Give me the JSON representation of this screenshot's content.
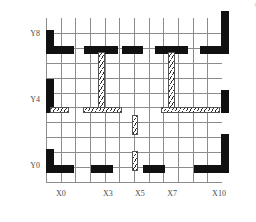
{
  "figure": {
    "type": "structural-floor-plan",
    "corner_note": "4F",
    "background_color": "#ffffff",
    "grid_color": "#8c8c8c",
    "solid_wall_color": "#111111",
    "hatch_wall_color": "#2b2b2b"
  },
  "axes": {
    "x_label_values": [
      "X0",
      "X3",
      "X5",
      "X7",
      "X10"
    ],
    "y_label_values": [
      "Y8",
      "Y4",
      "Y0"
    ],
    "x_grid_lines": 12,
    "y_grid_lines": 11,
    "x_range": [
      0,
      11
    ],
    "y_range": [
      0,
      10
    ]
  },
  "x_ticks": [
    {
      "label": "X0",
      "pos_pct": 8.5
    },
    {
      "label": "X3",
      "pos_pct": 35.2
    },
    {
      "label": "X5",
      "pos_pct": 53.4
    },
    {
      "label": "X7",
      "pos_pct": 71.6
    },
    {
      "label": "X10",
      "pos_pct": 98.3
    }
  ],
  "y_ticks": [
    {
      "label": "Y8",
      "pos_pct": 9.8
    },
    {
      "label": "Y4",
      "pos_pct": 50.0
    },
    {
      "label": "Y0",
      "pos_pct": 90.2
    }
  ],
  "chart_data": {
    "type": "table",
    "title": "",
    "legend": [
      {
        "key": "solid",
        "meaning": "reinforced-concrete shear wall"
      },
      {
        "key": "hatch",
        "meaning": "hatched infill / partition wall"
      }
    ],
    "walls_solid": [
      {
        "id": "w-tl-h",
        "x": 0.0,
        "y": 8.6,
        "w": 1.9,
        "h": 0.55
      },
      {
        "id": "w-tl-v",
        "x": 0.0,
        "y": 8.6,
        "w": 0.55,
        "h": 1.6
      },
      {
        "id": "w-t1",
        "x": 2.6,
        "y": 8.6,
        "w": 2.3,
        "h": 0.55
      },
      {
        "id": "w-t2",
        "x": 5.2,
        "y": 8.6,
        "w": 1.4,
        "h": 0.55
      },
      {
        "id": "w-t3",
        "x": 7.4,
        "y": 8.6,
        "w": 2.3,
        "h": 0.55
      },
      {
        "id": "w-tr-h",
        "x": 10.5,
        "y": 8.6,
        "w": 2.0,
        "h": 0.55
      },
      {
        "id": "w-tr-v",
        "x": 11.95,
        "y": 8.6,
        "w": 0.55,
        "h": 2.9
      },
      {
        "id": "w-ml-v",
        "x": 0.0,
        "y": 4.6,
        "w": 0.55,
        "h": 2.3
      },
      {
        "id": "w-mr-v",
        "x": 11.95,
        "y": 4.6,
        "w": 0.55,
        "h": 1.6
      },
      {
        "id": "w-br-v",
        "x": 11.95,
        "y": 0.6,
        "w": 0.55,
        "h": 2.6
      },
      {
        "id": "w-bl-v",
        "x": 0.0,
        "y": 0.6,
        "w": 0.55,
        "h": 1.6
      },
      {
        "id": "w-bl-h",
        "x": 0.0,
        "y": 0.6,
        "w": 1.9,
        "h": 0.55
      },
      {
        "id": "w-b1",
        "x": 3.1,
        "y": 0.6,
        "w": 1.5,
        "h": 0.55
      },
      {
        "id": "w-b2",
        "x": 6.6,
        "y": 0.6,
        "w": 1.5,
        "h": 0.55
      },
      {
        "id": "w-br-h",
        "x": 10.1,
        "y": 0.6,
        "w": 2.4,
        "h": 0.55
      }
    ],
    "walls_hatched": [
      {
        "id": "h-t-x3",
        "x": 3.55,
        "y": 4.9,
        "w": 0.45,
        "h": 3.8
      },
      {
        "id": "h-t-x7",
        "x": 8.35,
        "y": 4.9,
        "w": 0.45,
        "h": 3.8
      },
      {
        "id": "h-m-l0",
        "x": 0.25,
        "y": 4.65,
        "w": 1.35,
        "h": 0.4
      },
      {
        "id": "h-m-l1",
        "x": 2.55,
        "y": 4.65,
        "w": 2.65,
        "h": 0.4
      },
      {
        "id": "h-m-r1",
        "x": 7.85,
        "y": 4.65,
        "w": 4.0,
        "h": 0.4
      },
      {
        "id": "h-m-x5",
        "x": 5.85,
        "y": 3.15,
        "w": 0.45,
        "h": 1.35
      },
      {
        "id": "h-b-x5",
        "x": 5.85,
        "y": 0.75,
        "w": 0.45,
        "h": 1.3
      }
    ]
  }
}
